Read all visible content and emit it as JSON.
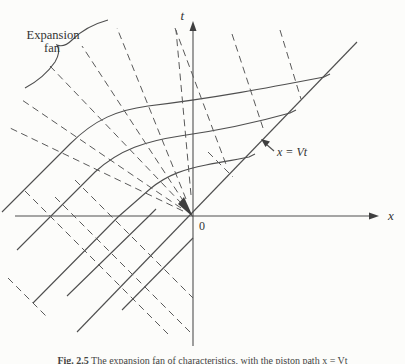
{
  "figure": {
    "labels": {
      "t_axis": "t",
      "x_axis": "x",
      "origin": "0",
      "fan_line1": "Expansion",
      "fan_line2": "fan",
      "vt_label": "x = Vt"
    },
    "caption": {
      "prefix": "Fig. 2.5",
      "text": " The expansion fan of characteristics, with the piston path x = Vt"
    },
    "colors": {
      "ink": "#4f4f4f",
      "background": "#fcfcfa"
    },
    "lines": [
      {
        "name": "x-axis-line",
        "style": "solid",
        "d": "M 15,216 L 375,216"
      },
      {
        "name": "x-axis-arrowhead",
        "style": "filled",
        "d": "M 379,216 L 369,212.5 L 369,219.5 Z"
      },
      {
        "name": "t-axis-line",
        "style": "solid",
        "d": "M 193,346 L 193,27"
      },
      {
        "name": "t-axis-arrowhead",
        "style": "filled",
        "d": "M 193,21 L 189.5,31 L 196.5,31 Z"
      },
      {
        "name": "x-equals-vt-line",
        "style": "solid",
        "d": "M 77,332 L 357,42"
      },
      {
        "name": "vt-pointer-line",
        "style": "solid",
        "d": "M 274,151 L 266,144"
      },
      {
        "name": "vt-pointer-arrowhead",
        "style": "filled",
        "d": "M 261,139 L 270,141.5 L 265.5,147 Z"
      },
      {
        "name": "characteristic-curve-a",
        "style": "solid",
        "d": "M 2,212 L 70,144 C 95,119 118,110 148,106 C 215,98 272,87 324,77 L 330,74"
      },
      {
        "name": "characteristic-curve-b",
        "style": "solid",
        "d": "M 17,250 L 95,172 C 120,149 147,141 180,136 C 222,130 258,122 290,113 L 296,110"
      },
      {
        "name": "characteristic-curve-c",
        "style": "solid",
        "d": "M 33,303 L 118,217 L 150,189 C 168,174 186,169 206,165 C 226,161 241,159 249,157 L 255,154"
      },
      {
        "name": "lower-solid-line-1",
        "style": "solid",
        "d": "M 122,310 L 193,238"
      },
      {
        "name": "lower-solid-line-2",
        "style": "solid",
        "d": "M 67,296 L 148,217 L 156,209"
      },
      {
        "name": "fan-ray-1",
        "style": "dashed",
        "d": "M 183,211 L 10,128"
      },
      {
        "name": "fan-ray-2",
        "style": "dashed",
        "d": "M 181,208 L 22,100"
      },
      {
        "name": "fan-ray-3",
        "style": "dashed",
        "d": "M 182,204 L 50,66"
      },
      {
        "name": "fan-ray-4",
        "style": "dashed",
        "d": "M 184,202 L 82,46"
      },
      {
        "name": "fan-ray-5",
        "style": "dashed",
        "d": "M 186,199 L 117,28"
      },
      {
        "name": "fan-ray-6",
        "style": "dashed",
        "d": "M 191,195 L 176,30"
      },
      {
        "name": "origin-convergence-blob",
        "style": "filled",
        "d": "M 193,217 L 178,204 L 184,197 Z"
      },
      {
        "name": "upper-dashed-line-1",
        "style": "dashed",
        "d": "M 175,28 L 227,167"
      },
      {
        "name": "upper-dashed-line-2",
        "style": "dashed",
        "d": "M 232,34 L 263,128"
      },
      {
        "name": "upper-dashed-line-3",
        "style": "dashed",
        "d": "M 280,30 L 301,99"
      },
      {
        "name": "short-dashed-segment",
        "style": "dashed",
        "d": "M 208,152 L 233,177"
      },
      {
        "name": "lower-dashed-line-1",
        "style": "dashed",
        "d": "M 25,191 L 168,334"
      },
      {
        "name": "lower-dashed-line-2",
        "style": "dashed",
        "d": "M 75,180 L 193,298"
      },
      {
        "name": "lower-dashed-line-3",
        "style": "dashed",
        "d": "M 55,197 L 190,332"
      },
      {
        "name": "lower-dashed-line-4",
        "style": "dashed",
        "d": "M 8,278 L 48,318"
      },
      {
        "name": "expansion-fan-brace",
        "style": "solid",
        "d": "M 108,20 Q 86,26 72,40 Q 64,48 57,45 Q 61,52 55,62 Q 44,78 25,88"
      }
    ]
  }
}
